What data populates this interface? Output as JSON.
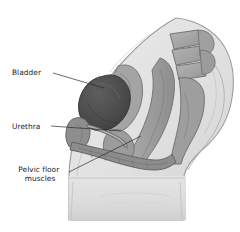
{
  "figure": {
    "name": "female-pelvis-sagittal-illustration",
    "width": 240,
    "height": 232,
    "background_color": "#ffffff",
    "style": "grayscale pencil-shaded medical illustration"
  },
  "labels": [
    {
      "id": "bladder",
      "text": "Bladder",
      "lines": [
        "Bladder"
      ],
      "text_x": 12,
      "text_y": 75,
      "align": "start",
      "leader": "M53,73 L104,88"
    },
    {
      "id": "urethra",
      "text": "Urethra",
      "lines": [
        "Urethra"
      ],
      "text_x": 12,
      "text_y": 129,
      "align": "start",
      "leader": "M51,126 L121,131"
    },
    {
      "id": "pelvic-floor-muscles",
      "text": "Pelvic floor muscles",
      "lines": [
        "Pelvic floor",
        "muscles"
      ],
      "text_x": 40,
      "text_y": 172,
      "align": "middle",
      "leader": "M69,172 L141,136"
    }
  ],
  "anatomy": {
    "body": {
      "name": "body-torso-thigh-outline",
      "fill": "#e2e2e2",
      "stroke": "#9c9c9c"
    },
    "structures": [
      {
        "name": "bladder",
        "fill": "#4e4e4e",
        "stroke": "#3a3a3a"
      },
      {
        "name": "uterus",
        "fill": "#a2a2a2",
        "stroke": "#6e6e6e"
      },
      {
        "name": "vagina",
        "fill": "#9a9a9a",
        "stroke": "#6e6e6e"
      },
      {
        "name": "rectum",
        "fill": "#a6a6a6",
        "stroke": "#6e6e6e"
      },
      {
        "name": "sacrum-vertebrae",
        "fill": "#a8a8a8",
        "stroke": "#6a6a6a"
      },
      {
        "name": "pubic-bone",
        "fill": "#8e8e8e",
        "stroke": "#5e5e5e"
      },
      {
        "name": "pelvic-floor-muscles",
        "fill": "#8a8a8a",
        "stroke": "#5e5e5e"
      },
      {
        "name": "urethra",
        "fill": "#9e9e9e",
        "stroke": "#6a6a6a"
      }
    ]
  },
  "colors": {
    "background": "#ffffff",
    "body_fill": "#e2e2e2",
    "body_stroke": "#9c9c9c",
    "organ_mid": "#9a9a9a",
    "organ_dark": "#4e4e4e",
    "label_text": "#1a1a1a",
    "leader_line": "#2a2a2a"
  }
}
